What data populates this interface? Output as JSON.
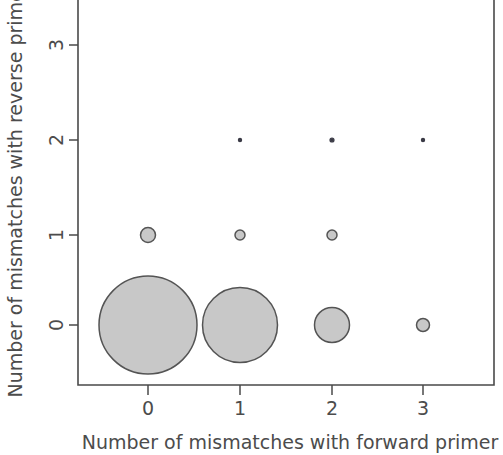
{
  "figure": {
    "background_color": "#ffffff",
    "bubble_fill_color": "#c8c8c8",
    "bubble_stroke_color": "#545454",
    "axis_color": "#4a4a4a",
    "text_color": "#4c4c4c"
  },
  "chart_data": {
    "type": "scatter",
    "title": "",
    "subtitle": "",
    "xlabel": "Number of mismatches with forward primer",
    "ylabel": "Number of mismatches with reverse primer",
    "xticklabels": [
      "0",
      "1",
      "2",
      "3"
    ],
    "yticklabels": [
      "0",
      "1",
      "2",
      "3"
    ],
    "xticks": [
      0,
      1,
      2,
      3
    ],
    "yticks": [
      0,
      1,
      2,
      3
    ],
    "xlim": [
      -0.75,
      3.75
    ],
    "ylim": [
      -0.65,
      3.45
    ],
    "grid": false,
    "legend": null,
    "legend_position": "none",
    "marker": "filled-circle-with-outline",
    "size_encodes": "count",
    "points": [
      {
        "x": 0,
        "y": 0,
        "radius_px": 49.0
      },
      {
        "x": 1,
        "y": 0,
        "radius_px": 37.5
      },
      {
        "x": 2,
        "y": 0,
        "radius_px": 17.5
      },
      {
        "x": 3,
        "y": 0,
        "radius_px": 6.5
      },
      {
        "x": 0,
        "y": 1,
        "radius_px": 7.5
      },
      {
        "x": 1,
        "y": 1,
        "radius_px": 5.0
      },
      {
        "x": 2,
        "y": 1,
        "radius_px": 5.0
      },
      {
        "x": 1,
        "y": 2,
        "radius_px": 1.6
      },
      {
        "x": 2,
        "y": 2,
        "radius_px": 2.0
      },
      {
        "x": 3,
        "y": 2,
        "radius_px": 1.6
      }
    ]
  },
  "axes_geometry": {
    "x_pixel_for": {
      "0": 148,
      "1": 240,
      "2": 332,
      "3": 423
    },
    "y_pixel_for": {
      "0": 325,
      "1": 235,
      "2": 140,
      "3": 45
    },
    "box_left_px": 78,
    "box_right_px": 494,
    "box_bottom_px": 385,
    "box_top_px": 0
  }
}
